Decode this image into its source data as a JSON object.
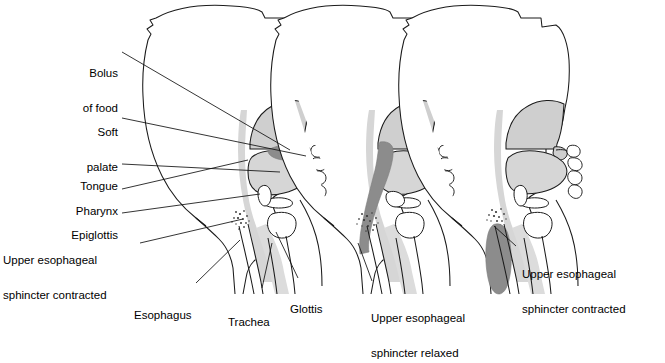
{
  "figure": {
    "title_visible": false,
    "type": "anatomical-diagram",
    "panels": [
      {
        "id": "panel-1",
        "stage_label": "Bolus on tongue, upper esophageal sphincter contracted",
        "bolus_position": "oral cavity on tongue"
      },
      {
        "id": "panel-2",
        "stage_label": "Bolus in pharynx, upper esophageal sphincter relaxed",
        "bolus_position": "pharynx"
      },
      {
        "id": "panel-3",
        "stage_label": "Bolus in esophagus, upper esophageal sphincter contracted",
        "bolus_position": "esophagus"
      }
    ]
  },
  "colors": {
    "outline": "#1b1b1b",
    "cavity_fill": "#d6d6d6",
    "tissue_fill": "#cfcfcf",
    "bolus_fill": "#8c8c8c",
    "background": "#ffffff",
    "leader_line": "#111111",
    "text": "#000000"
  },
  "labels": {
    "bolus_of_food": {
      "line1": "Bolus",
      "line2": "of food"
    },
    "soft_palate": {
      "line1": "Soft",
      "line2": "palate"
    },
    "tongue": {
      "line1": "Tongue"
    },
    "pharynx": {
      "line1": "Pharynx"
    },
    "epiglottis": {
      "line1": "Epiglottis"
    },
    "ues_contracted_left": {
      "line1": "Upper esophageal",
      "line2": "sphincter contracted"
    },
    "esophagus": {
      "line1": "Esophagus"
    },
    "trachea": {
      "line1": "Trachea"
    },
    "glottis": {
      "line1": "Glottis"
    },
    "ues_relaxed": {
      "line1": "Upper esophageal",
      "line2": "sphincter relaxed"
    },
    "ues_contracted_right": {
      "line1": "Upper esophageal",
      "line2": "sphincter contracted"
    }
  }
}
